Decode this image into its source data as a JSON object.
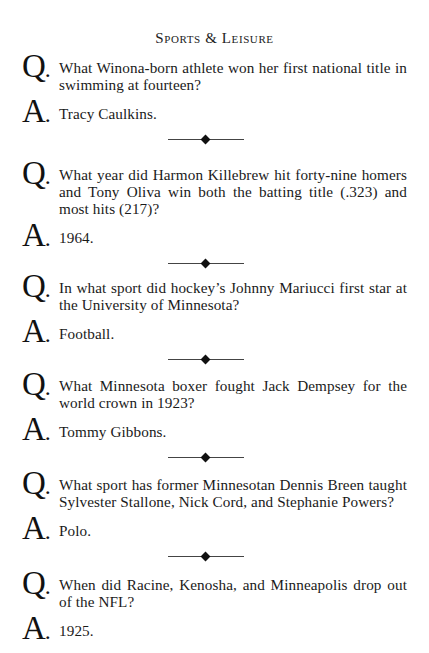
{
  "page": {
    "section_title": "Sports & Leisure"
  },
  "labels": {
    "question_letter": "Q",
    "answer_letter": "A",
    "punct": "."
  },
  "items": [
    {
      "question": "What Winona-born athlete won her first national title in swimming at fourteen?",
      "answer": "Tracy Caulkins."
    },
    {
      "question": "What year did Harmon Killebrew hit forty-nine homers and Tony Oliva win both the batting title (.323) and most hits (217)?",
      "answer": "1964."
    },
    {
      "question": "In what sport did hockey’s Johnny Mariucci first star at the University of Minnesota?",
      "answer": "Football."
    },
    {
      "question": "What Minnesota boxer fought Jack Dempsey for the world crown in 1923?",
      "answer": "Tommy Gibbons."
    },
    {
      "question": "What sport has former Minnesotan Dennis Breen taught Sylvester Stallone, Nick Cord, and Stephanie Powers?",
      "answer": "Polo."
    },
    {
      "question": "When did Racine, Kenosha, and Minneapolis drop out of the NFL?",
      "answer": "1925."
    }
  ],
  "separator_icon": "diamond-rule-ornament"
}
